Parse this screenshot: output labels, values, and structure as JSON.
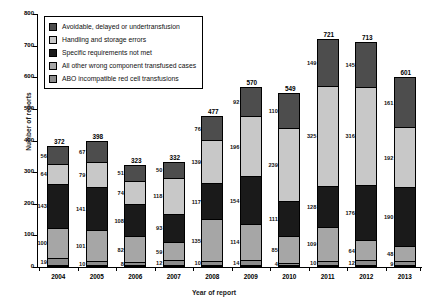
{
  "chart_data": {
    "type": "bar",
    "subtype": "stacked-vertical",
    "title": "",
    "xlabel": "Year of report",
    "ylabel": "Number of reports",
    "ylim": [
      0,
      800
    ],
    "yticks": [
      0,
      100,
      200,
      300,
      400,
      500,
      600,
      700,
      800
    ],
    "grid": false,
    "legend_position": "top-left-inside",
    "categories": [
      "2004",
      "2005",
      "2006",
      "2007",
      "2008",
      "2009",
      "2010",
      "2011",
      "2012",
      "2013"
    ],
    "series": [
      {
        "name": "Avoidable, delayed or undertransfusion",
        "color": "#4d4d4d",
        "values": [
          56,
          67,
          51,
          50,
          76,
          92,
          110,
          149,
          145,
          161
        ]
      },
      {
        "name": "Handling and storage errors",
        "color": "#c8c8c8",
        "values": [
          64,
          79,
          74,
          118,
          139,
          196,
          239,
          325,
          316,
          192
        ]
      },
      {
        "name": "Specific requirements not met",
        "color": "#1a1a1a",
        "values": [
          143,
          141,
          108,
          93,
          117,
          154,
          111,
          128,
          176,
          190
        ]
      },
      {
        "name": "All other wrong component transfused cases",
        "color": "#a6a6a6",
        "values": [
          100,
          101,
          82,
          59,
          135,
          114,
          85,
          109,
          64,
          48
        ]
      },
      {
        "name": "ABO incompatible red cell transfusions",
        "color": "#8c8c8c",
        "values": [
          19,
          10,
          8,
          12,
          10,
          14,
          4,
          10,
          12,
          9
        ]
      }
    ],
    "totals": [
      372,
      398,
      323,
      332,
      477,
      570,
      549,
      721,
      713,
      601
    ]
  },
  "legend": {
    "items": [
      {
        "label": "Avoidable, delayed or undertransfusion",
        "color": "#4d4d4d"
      },
      {
        "label": "Handling and storage errors",
        "color": "#c8c8c8"
      },
      {
        "label": "Specific requirements not met",
        "color": "#1a1a1a"
      },
      {
        "label": "All other wrong component transfused cases",
        "color": "#a6a6a6"
      },
      {
        "label": "ABO incompatible red cell transfusions",
        "color": "#8c8c8c"
      }
    ]
  },
  "axes": {
    "y_title": "Number of reports",
    "x_title": "Year of report"
  }
}
